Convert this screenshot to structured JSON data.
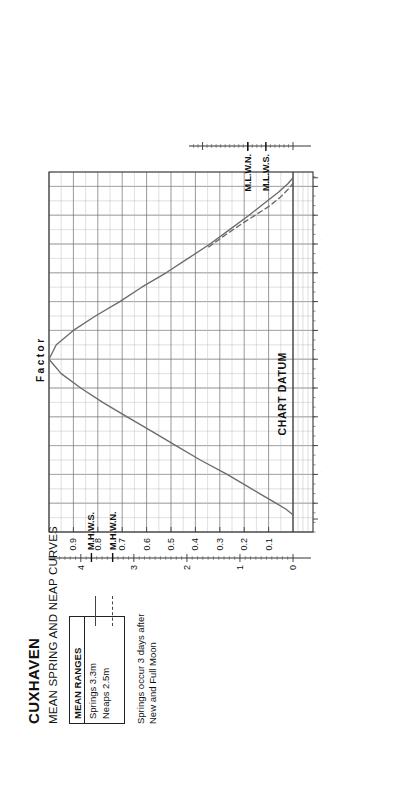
{
  "title": "CUXHAVEN",
  "subtitle": "MEAN SPRING AND NEAP CURVES",
  "legend": {
    "header": "MEAN RANGES",
    "springs": "Springs 3.3m",
    "neaps": "Neaps 2.5m"
  },
  "note_line1": "Springs occur 3 days after",
  "note_line2": "New and Full Moon",
  "chart_datum_label": "CHART DATUM",
  "factor_title": "Factor",
  "left_axis": {
    "label": "H.W.Hts.m.",
    "ticks": [
      "0",
      "1",
      "2",
      "3",
      "4"
    ],
    "markers": [
      {
        "name": "M.H.W.S.",
        "value": 3.8
      },
      {
        "name": "M.H.W.N.",
        "value": 3.4
      }
    ]
  },
  "right_axis": {
    "label": "L.W.Hts.m.",
    "ticks": [
      "0",
      "1",
      "2"
    ],
    "markers": [
      {
        "name": "M.L.W.N.",
        "value": 1.0
      },
      {
        "name": "M.L.W.S.",
        "value": 0.6
      }
    ]
  },
  "time_axis": {
    "high_water_label": "H.W",
    "low_water_label": "L.W",
    "before": [
      "-1ʰ",
      "-2ʰ",
      "-3ʰ",
      "-4ʰ",
      "-5ʰ"
    ],
    "after": [
      "+1ʰ",
      "+2ʰ",
      "+3ʰ",
      "+4ʰ",
      "+5ʰ",
      "+6ʰ"
    ]
  },
  "colors": {
    "curve": "#6b6b6b",
    "grid_major": "#6f6f6f",
    "grid_minor": "#b9b9b9",
    "frame": "#333333",
    "text": "#111111"
  },
  "chart_data": {
    "type": "line",
    "xlabel": "Factor",
    "ylabel": "Time relative to High Water (hours)",
    "xlim": [
      0.0,
      1.0
    ],
    "ylim": [
      -6.0,
      6.5
    ],
    "grid": true,
    "legend_position": "top-left",
    "factor_ticks": [
      0.1,
      0.2,
      0.3,
      0.4,
      0.5,
      0.6,
      0.7,
      0.8,
      0.9
    ],
    "hw_height_ticks": [
      0,
      1,
      2,
      3,
      4
    ],
    "lw_height_ticks": [
      0,
      1,
      2
    ],
    "series": [
      {
        "name": "Springs 3.3m",
        "style": "solid",
        "points": [
          {
            "hours": -5.4,
            "factor": 0.0
          },
          {
            "hours": -5.2,
            "factor": 0.03
          },
          {
            "hours": -5.0,
            "factor": 0.07
          },
          {
            "hours": -4.7,
            "factor": 0.13
          },
          {
            "hours": -4.4,
            "factor": 0.19
          },
          {
            "hours": -4.0,
            "factor": 0.27
          },
          {
            "hours": -3.5,
            "factor": 0.38
          },
          {
            "hours": -3.0,
            "factor": 0.48
          },
          {
            "hours": -2.5,
            "factor": 0.58
          },
          {
            "hours": -2.0,
            "factor": 0.68
          },
          {
            "hours": -1.5,
            "factor": 0.78
          },
          {
            "hours": -1.0,
            "factor": 0.87
          },
          {
            "hours": -0.5,
            "factor": 0.95
          },
          {
            "hours": 0.0,
            "factor": 1.0
          },
          {
            "hours": 0.5,
            "factor": 0.97
          },
          {
            "hours": 1.0,
            "factor": 0.9
          },
          {
            "hours": 1.5,
            "factor": 0.81
          },
          {
            "hours": 2.0,
            "factor": 0.71
          },
          {
            "hours": 2.5,
            "factor": 0.62
          },
          {
            "hours": 3.0,
            "factor": 0.52
          },
          {
            "hours": 3.5,
            "factor": 0.43
          },
          {
            "hours": 4.0,
            "factor": 0.34
          },
          {
            "hours": 4.5,
            "factor": 0.26
          },
          {
            "hours": 5.0,
            "factor": 0.18
          },
          {
            "hours": 5.4,
            "factor": 0.12
          },
          {
            "hours": 5.8,
            "factor": 0.06
          },
          {
            "hours": 6.1,
            "factor": 0.02
          },
          {
            "hours": 6.3,
            "factor": 0.0
          }
        ]
      },
      {
        "name": "Neaps 2.5m",
        "style": "dashed",
        "points": [
          {
            "hours": 3.9,
            "factor": 0.345
          },
          {
            "hours": 4.3,
            "factor": 0.28
          },
          {
            "hours": 4.7,
            "factor": 0.21
          },
          {
            "hours": 5.0,
            "factor": 0.155
          },
          {
            "hours": 5.3,
            "factor": 0.1
          },
          {
            "hours": 5.6,
            "factor": 0.055
          },
          {
            "hours": 5.9,
            "factor": 0.02
          },
          {
            "hours": 6.1,
            "factor": 0.0
          }
        ]
      }
    ]
  }
}
